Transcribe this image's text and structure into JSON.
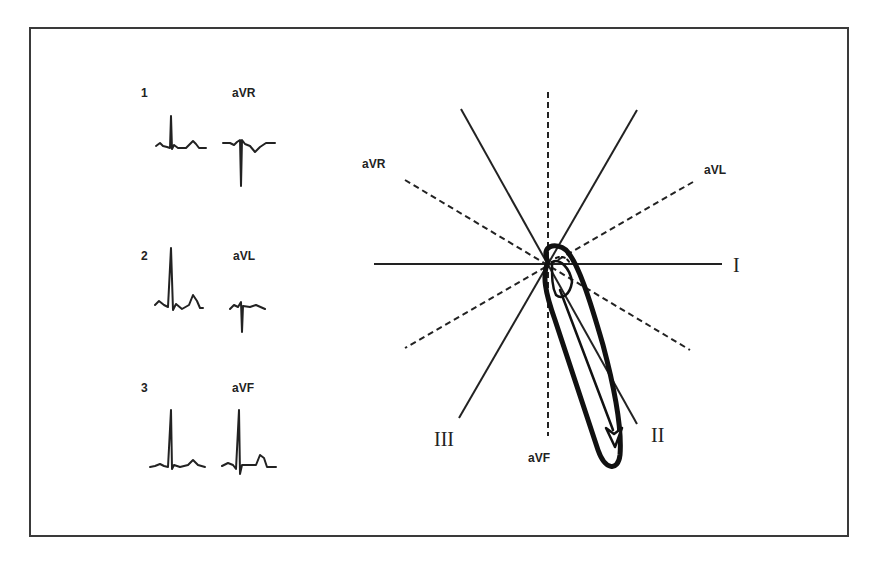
{
  "figure": {
    "stroke_color": "#222222",
    "background": "#ffffff"
  },
  "ecg_panel": {
    "rows": [
      {
        "limb_label": "1",
        "augmented_label": "aVR"
      },
      {
        "limb_label": "2",
        "augmented_label": "aVL"
      },
      {
        "limb_label": "3",
        "augmented_label": "aVF"
      }
    ]
  },
  "hexaxial": {
    "leads": {
      "I": "I",
      "II": "II",
      "III": "III",
      "aVR": "aVR",
      "aVL": "aVL",
      "aVF": "aVF"
    },
    "solid_axes": [
      "I",
      "II",
      "III"
    ],
    "dashed_axes": [
      "aVR",
      "aVL",
      "aVF"
    ],
    "mean_axis_lead": "II"
  }
}
